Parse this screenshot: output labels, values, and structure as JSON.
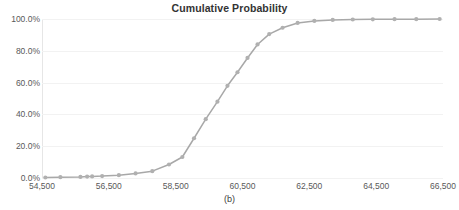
{
  "chart_data": {
    "type": "line",
    "title": "Cumulative Probability",
    "caption": "(b)",
    "xlabel": "",
    "ylabel": "",
    "grid": true,
    "legend": false,
    "xlim": [
      54500,
      66500
    ],
    "ylim": [
      0,
      100
    ],
    "x_tick_labels": [
      "54,500",
      "56,500",
      "58,500",
      "60,500",
      "62,500",
      "64,500",
      "66,500"
    ],
    "x_tick_values": [
      54500,
      56500,
      58500,
      60500,
      62500,
      64500,
      66500
    ],
    "y_tick_labels": [
      "0.0%",
      "20.0%",
      "40.0%",
      "60.0%",
      "80.0%",
      "100.0%"
    ],
    "y_tick_values": [
      0,
      20,
      40,
      60,
      80,
      100
    ],
    "series": [
      {
        "name": "Cumulative Probability",
        "marker": "circle",
        "color": "#a8a8a8",
        "x": [
          54600,
          55050,
          55650,
          55850,
          56000,
          56300,
          56800,
          57300,
          57800,
          58300,
          58700,
          59050,
          59400,
          59750,
          60050,
          60350,
          60650,
          60950,
          61300,
          61700,
          62150,
          62650,
          63200,
          63800,
          64400,
          65050,
          65700,
          66400
        ],
        "values": [
          0.3,
          0.5,
          0.7,
          0.9,
          1.0,
          1.2,
          1.8,
          2.9,
          4.3,
          8.5,
          13.2,
          25.0,
          37.0,
          48.0,
          58.0,
          66.5,
          75.5,
          84.0,
          90.5,
          94.5,
          97.5,
          98.8,
          99.4,
          99.7,
          99.8,
          99.9,
          99.9,
          100.0
        ]
      }
    ]
  },
  "axis_colors": {
    "line": "#a8a8a8",
    "marker": "#b0b0b0",
    "grid": "#f2f2f2",
    "text": "#595959"
  }
}
